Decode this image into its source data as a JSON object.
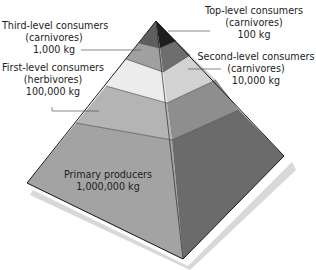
{
  "diagram": {
    "type": "ecological-pyramid",
    "levels": [
      {
        "name": "Top-level consumers",
        "type": "(carnivores)",
        "mass": "100 kg",
        "fill": "#2a2a2a"
      },
      {
        "name": "Third-level consumers",
        "type": "(carnivores)",
        "mass": "1,000 kg",
        "fill": "#8a8a8a"
      },
      {
        "name": "Second-level consumers",
        "type": "(carnivores)",
        "mass": "10,000 kg",
        "fill": "#dcdcdc"
      },
      {
        "name": "First-level consumers",
        "type": "(herbivores)",
        "mass": "100,000 kg",
        "fill": "#a9a9a9"
      },
      {
        "name": "Primary producers",
        "type": "",
        "mass": "1,000,000 kg",
        "fill": "#9c9c9c"
      }
    ],
    "colors": {
      "background": "#ffffff",
      "outline": "#1a1a1a",
      "shadow": "#d6d6d6",
      "leader": "#555555",
      "text": "#222222"
    }
  }
}
